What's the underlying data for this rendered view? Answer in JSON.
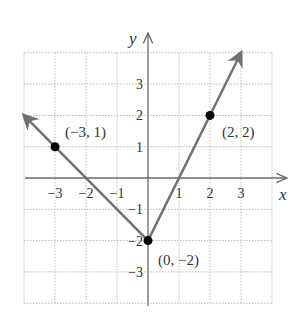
{
  "chart_data": {
    "type": "line",
    "title": "",
    "xlabel": "x",
    "ylabel": "y",
    "xlim": [
      -4,
      4
    ],
    "ylim": [
      -4,
      4
    ],
    "grid": true,
    "x_ticks": [
      -3,
      -2,
      -1,
      1,
      2,
      3
    ],
    "y_ticks": [
      3,
      2,
      1,
      -1,
      -2,
      -3
    ],
    "x_tick_labels": [
      "−3",
      "−2",
      "−1",
      "1",
      "2",
      "3"
    ],
    "y_tick_labels": [
      "3",
      "2",
      "1",
      "−1",
      "−2",
      "−3"
    ],
    "series": [
      {
        "name": "V-shaped graph",
        "x": [
          -4,
          0,
          3
        ],
        "y": [
          2,
          -2,
          4
        ],
        "arrows_at_ends": true
      }
    ],
    "points": [
      {
        "x": -3,
        "y": 1,
        "label": "(−3, 1)"
      },
      {
        "x": 2,
        "y": 2,
        "label": "(2, 2)"
      },
      {
        "x": 0,
        "y": -2,
        "label": "(0, −2)"
      }
    ],
    "colors": {
      "line": "#707070",
      "grid": "#b8b8b8",
      "point": "#000000",
      "axis": "#6a6a6a"
    }
  }
}
